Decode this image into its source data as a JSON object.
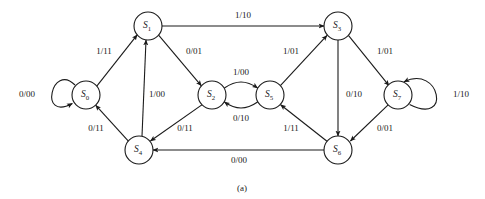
{
  "figure": {
    "caption": "(a)",
    "width": 485,
    "height": 199,
    "background_color": "#ffffff",
    "ink_color": "#1a1a1a"
  },
  "diagram_data": {
    "type": "state-transition-diagram",
    "notation": "input/output",
    "nodes": [
      {
        "id": "S0",
        "name": "S",
        "subscript": "0",
        "label": "S0",
        "cx": 86,
        "cy": 95,
        "r": 14
      },
      {
        "id": "S1",
        "name": "S",
        "subscript": "1",
        "label": "S1",
        "cx": 148,
        "cy": 26,
        "r": 14
      },
      {
        "id": "S2",
        "name": "S",
        "subscript": "2",
        "label": "S2",
        "cx": 212,
        "cy": 95,
        "r": 14
      },
      {
        "id": "S3",
        "name": "S",
        "subscript": "3",
        "label": "S3",
        "cx": 338,
        "cy": 26,
        "r": 14
      },
      {
        "id": "S4",
        "name": "S",
        "subscript": "4",
        "label": "S4",
        "cx": 139,
        "cy": 150,
        "r": 14
      },
      {
        "id": "S5",
        "name": "S",
        "subscript": "5",
        "label": "S5",
        "cx": 270,
        "cy": 95,
        "r": 14
      },
      {
        "id": "S6",
        "name": "S",
        "subscript": "6",
        "label": "S6",
        "cx": 338,
        "cy": 150,
        "r": 14
      },
      {
        "id": "S7",
        "name": "S",
        "subscript": "7",
        "label": "S7",
        "cx": 398,
        "cy": 95,
        "r": 14
      }
    ],
    "edges": [
      {
        "from": "S0",
        "to": "S0",
        "label": "0/00",
        "kind": "self-loop",
        "label_x": 27,
        "label_y": 95
      },
      {
        "from": "S0",
        "to": "S1",
        "label": "1/11",
        "kind": "straight",
        "label_x": 104,
        "label_y": 52
      },
      {
        "from": "S1",
        "to": "S3",
        "label": "1/10",
        "kind": "straight",
        "label_x": 243,
        "label_y": 16
      },
      {
        "from": "S1",
        "to": "S2",
        "label": "0/01",
        "kind": "straight",
        "label_x": 194,
        "label_y": 52
      },
      {
        "from": "S2",
        "to": "S5",
        "label": "1/00",
        "kind": "curve",
        "label_x": 241,
        "label_y": 76
      },
      {
        "from": "S5",
        "to": "S2",
        "label": "0/10",
        "kind": "curve",
        "label_x": 241,
        "label_y": 117
      },
      {
        "from": "S2",
        "to": "S4",
        "label": "0/11",
        "kind": "straight",
        "label_x": 185,
        "label_y": 129
      },
      {
        "from": "S4",
        "to": "S1",
        "label": "1/00",
        "kind": "straight",
        "label_x": 155,
        "label_y": 95
      },
      {
        "from": "S4",
        "to": "S0",
        "label": "0/11",
        "kind": "straight",
        "label_x": 96,
        "label_y": 129
      },
      {
        "from": "S5",
        "to": "S3",
        "label": "1/01",
        "kind": "straight",
        "label_x": 291,
        "label_y": 52
      },
      {
        "from": "S3",
        "to": "S6",
        "label": "0/10",
        "kind": "straight",
        "label_x": 352,
        "label_y": 95
      },
      {
        "from": "S3",
        "to": "S7",
        "label": "1/01",
        "kind": "straight",
        "label_x": 385,
        "label_y": 52
      },
      {
        "from": "S7",
        "to": "S7",
        "label": "1/10",
        "kind": "self-loop",
        "label_x": 459,
        "label_y": 95
      },
      {
        "from": "S7",
        "to": "S6",
        "label": "0/01",
        "kind": "straight",
        "label_x": 385,
        "label_y": 129
      },
      {
        "from": "S6",
        "to": "S5",
        "label": "1/11",
        "kind": "straight",
        "label_x": 291,
        "label_y": 129
      },
      {
        "from": "S6",
        "to": "S4",
        "label": "0/00",
        "kind": "straight",
        "label_x": 239,
        "label_y": 161
      }
    ]
  }
}
